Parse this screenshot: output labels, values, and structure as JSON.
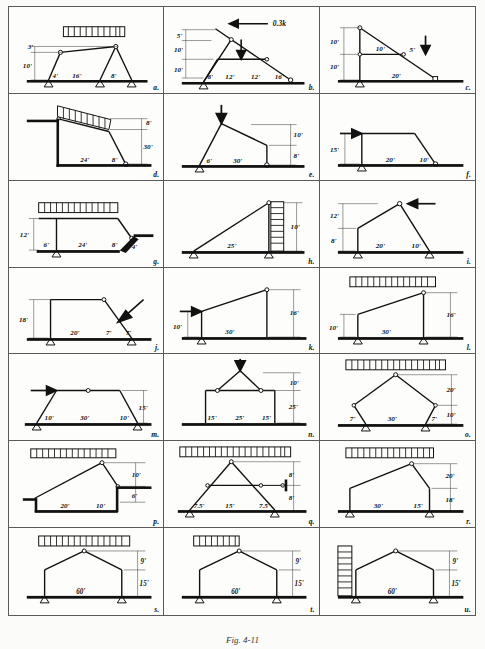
{
  "figure": {
    "caption": "Fig. 4-11",
    "panel_count": 21,
    "units": "feet (ft), loads in kips (k)",
    "colors": {
      "ink": "#111111",
      "ground": "#000000",
      "paper": "#fbfbf9",
      "rule": "#5a5a5a"
    }
  },
  "panels": [
    {
      "id": "a",
      "label": "a.",
      "description": "Gable frame with uniform distributed load on top chord, two hinges at knees, inclined legs",
      "dimensions": [
        "3'",
        "10'",
        "4'",
        "16'",
        "8'"
      ],
      "load": "uniform-distributed",
      "supports": [
        "pin",
        "pin",
        "pin"
      ]
    },
    {
      "id": "b",
      "label": "b.",
      "description": "Inclined frame with horizontal point load and vertical point load on tie member",
      "dimensions": [
        "5'",
        "10'",
        "10'",
        "8'",
        "12'",
        "12'",
        "16'"
      ],
      "load": "0.3k",
      "point_load_label": "0.3k",
      "supports": [
        "pin",
        "roller"
      ]
    },
    {
      "id": "c",
      "label": "c.",
      "description": "Vertical column with inclined strut and horizontal tie, vertical point load on incline",
      "dimensions": [
        "10'",
        "10'",
        "10'",
        "5'",
        "20'"
      ],
      "load": "point-vertical",
      "supports": [
        "pin",
        "roller"
      ]
    },
    {
      "id": "d",
      "label": "d.",
      "description": "Tall frame on elevated base with inclined distributed load on top, inclined leg to roller",
      "dimensions": [
        "8'",
        "30'",
        "24'",
        "8'"
      ],
      "load": "uniform-distributed-inclined",
      "supports": [
        "fixed-base",
        "roller"
      ]
    },
    {
      "id": "e",
      "label": "e.",
      "description": "Asymmetric frame with vertical point load at apex, short column to roller",
      "dimensions": [
        "10'",
        "8'",
        "6'",
        "30'"
      ],
      "load": "point-vertical",
      "supports": [
        "pin",
        "roller"
      ]
    },
    {
      "id": "f",
      "label": "f.",
      "description": "Portal frame with horizontal point load at top-left, sloping right leg to roller",
      "dimensions": [
        "15'",
        "20'",
        "10'"
      ],
      "load": "point-horizontal",
      "supports": [
        "pin",
        "roller"
      ]
    },
    {
      "id": "g",
      "label": "g.",
      "description": "Frame with uniform distributed load on horizontal top, stepped right extension",
      "dimensions": [
        "12'",
        "6'",
        "24'",
        "8'",
        "4'"
      ],
      "load": "uniform-distributed",
      "supports": [
        "pin",
        "fixed"
      ]
    },
    {
      "id": "h",
      "label": "h.",
      "description": "Right triangle frame with uniform distributed lateral load on vertical right member",
      "dimensions": [
        "10'",
        "25'"
      ],
      "load": "uniform-distributed-lateral",
      "supports": [
        "pin",
        "pin"
      ]
    },
    {
      "id": "i",
      "label": "i.",
      "description": "Gable frame with horizontal point load at apex hinge",
      "dimensions": [
        "12'",
        "8'",
        "20'",
        "10'"
      ],
      "load": "point-horizontal",
      "supports": [
        "pin",
        "pin"
      ]
    },
    {
      "id": "j",
      "label": "j.",
      "description": "Portal frame with inclined point load on right sloping member",
      "dimensions": [
        "18'",
        "20'",
        "7'",
        "7'"
      ],
      "load": "point-inclined",
      "supports": [
        "pin",
        "roller"
      ]
    },
    {
      "id": "k",
      "label": "k.",
      "description": "Sloped-top frame with horizontal point load at left knee",
      "dimensions": [
        "10'",
        "30'",
        "16'"
      ],
      "load": "point-horizontal",
      "supports": [
        "pin",
        "roller"
      ]
    },
    {
      "id": "l",
      "label": "l.",
      "description": "Sloped-top frame with uniform distributed load across inclined top chord",
      "dimensions": [
        "10'",
        "30'",
        "16'"
      ],
      "load": "uniform-distributed",
      "supports": [
        "pin",
        "pin"
      ]
    },
    {
      "id": "m",
      "label": "m.",
      "description": "Trapezoidal frame with central hinge and horizontal point load at left knee",
      "dimensions": [
        "15'",
        "10'",
        "30'",
        "10'"
      ],
      "load": "point-horizontal",
      "supports": [
        "pin",
        "pin"
      ]
    },
    {
      "id": "n",
      "label": "n.",
      "description": "Portal frame with A-frame top, vertical point load at apex, two hinges",
      "dimensions": [
        "10'",
        "25'",
        "15'",
        "25'",
        "15'"
      ],
      "load": "point-vertical",
      "supports": [
        "fixed",
        "fixed"
      ]
    },
    {
      "id": "o",
      "label": "o.",
      "description": "Pentagonal frame with uniform distributed load over apex, splayed legs",
      "dimensions": [
        "20'",
        "10'",
        "7'",
        "30'",
        "7'"
      ],
      "load": "uniform-distributed",
      "supports": [
        "pin",
        "pin"
      ]
    },
    {
      "id": "p",
      "label": "p.",
      "description": "Asymmetric frame with uniform distributed load, stepped base and right ledge",
      "dimensions": [
        "10'",
        "6'",
        "20'",
        "10'"
      ],
      "load": "uniform-distributed",
      "supports": [
        "pin",
        "fixed"
      ]
    },
    {
      "id": "q",
      "label": "q.",
      "description": "Triangular truss frame with uniform distributed load, horizontal tie with roller",
      "dimensions": [
        "8'",
        "8'",
        "7.5'",
        "15'",
        "7.5'"
      ],
      "load": "uniform-distributed",
      "supports": [
        "pin",
        "pin"
      ]
    },
    {
      "id": "r",
      "label": "r.",
      "description": "Asymmetric gable frame with uniform distributed load over long slope",
      "dimensions": [
        "20'",
        "18'",
        "30'",
        "15'"
      ],
      "load": "uniform-distributed",
      "supports": [
        "roller",
        "pin"
      ]
    },
    {
      "id": "s",
      "label": "s.",
      "description": "Symmetric gable frame, 60 ft span, uniform distributed load on both roof slopes",
      "dimensions": [
        "9'",
        "15'",
        "60'"
      ],
      "load": "uniform-distributed",
      "supports": [
        "pin",
        "pin"
      ]
    },
    {
      "id": "t",
      "label": "t.",
      "description": "Symmetric gable frame, 60 ft span, uniform distributed load on left roof slope only",
      "dimensions": [
        "9'",
        "15'",
        "60'"
      ],
      "load": "uniform-distributed-partial",
      "supports": [
        "pin",
        "pin"
      ]
    },
    {
      "id": "u",
      "label": "u.",
      "description": "Symmetric gable frame, 60 ft span, uniform distributed lateral load on left column",
      "dimensions": [
        "9'",
        "15'",
        "60'"
      ],
      "load": "uniform-distributed-lateral",
      "supports": [
        "pin",
        "pin"
      ]
    }
  ],
  "dimension_text": {
    "a": {
      "d1": "3'",
      "d2": "10'",
      "d3": "4'",
      "d4": "16'",
      "d5": "8'"
    },
    "b": {
      "d1": "5'",
      "d2": "10'",
      "d3": "10'",
      "d4": "8'",
      "d5": "12'",
      "d6": "12'",
      "d7": "16'",
      "load": "0.3k"
    },
    "c": {
      "d1": "10'",
      "d2": "10'",
      "d3": "10'",
      "d4": "5'",
      "d5": "20'"
    },
    "d": {
      "d1": "8'",
      "d2": "30'",
      "d3": "24'",
      "d4": "8'"
    },
    "e": {
      "d1": "10'",
      "d2": "8'",
      "d3": "6'",
      "d4": "30'"
    },
    "f": {
      "d1": "15'",
      "d2": "20'",
      "d3": "10'"
    },
    "g": {
      "d1": "12'",
      "d2": "6'",
      "d3": "24'",
      "d4": "8'",
      "d5": "4'"
    },
    "h": {
      "d1": "10'",
      "d2": "25'"
    },
    "i": {
      "d1": "12'",
      "d2": "8'",
      "d3": "20'",
      "d4": "10'"
    },
    "j": {
      "d1": "18'",
      "d2": "20'",
      "d3": "7'",
      "d4": "7'"
    },
    "k": {
      "d1": "10'",
      "d2": "30'",
      "d3": "16'"
    },
    "l": {
      "d1": "10'",
      "d2": "30'",
      "d3": "16'"
    },
    "m": {
      "d1": "15'",
      "d2": "10'",
      "d3": "30'",
      "d4": "10'"
    },
    "n": {
      "d1": "10'",
      "d2": "25'",
      "d3": "15'",
      "d4": "25'",
      "d5": "15'"
    },
    "o": {
      "d1": "20'",
      "d2": "10'",
      "d3": "7'",
      "d4": "30'",
      "d5": "7'"
    },
    "p": {
      "d1": "10'",
      "d2": "6'",
      "d3": "20'",
      "d4": "10'"
    },
    "q": {
      "d1": "8'",
      "d2": "8'",
      "d3": "7.5'",
      "d4": "15'",
      "d5": "7.5'"
    },
    "r": {
      "d1": "20'",
      "d2": "18'",
      "d3": "30'",
      "d4": "15'"
    },
    "s": {
      "d1": "9'",
      "d2": "15'",
      "d3": "60'"
    },
    "t": {
      "d1": "9'",
      "d2": "15'",
      "d3": "60'"
    },
    "u": {
      "d1": "9'",
      "d2": "15'",
      "d3": "60'"
    }
  }
}
